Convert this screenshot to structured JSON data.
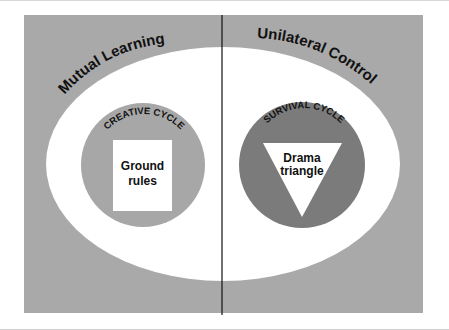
{
  "diagram": {
    "left_region": {
      "title": "Mutual Learning",
      "cycle_label": "CREATIVE CYCLE",
      "center_shape": "square",
      "center_label_line1": "Ground",
      "center_label_line2": "rules"
    },
    "right_region": {
      "title": "Unilateral Control",
      "cycle_label": "SURVIVAL CYCLE",
      "center_shape": "inverted-triangle",
      "center_label_line1": "Drama",
      "center_label_line2": "triangle"
    },
    "colors": {
      "background_panel": "#a9a9a9",
      "ellipse": "#ffffff",
      "creative_circle": "#a7a7a7",
      "survival_circle": "#7b7b7b",
      "center_shapes": "#ffffff",
      "divider": "#111111",
      "text": "#111111"
    }
  }
}
